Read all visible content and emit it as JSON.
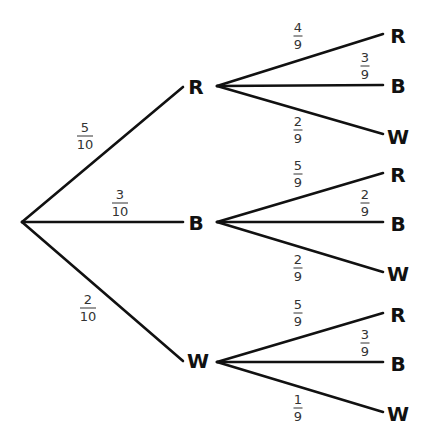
{
  "diagram": {
    "type": "probability-tree",
    "root": {
      "x": 22,
      "y": 222
    },
    "level1": [
      {
        "label": "R",
        "prob": {
          "num": "5",
          "den": "10"
        },
        "label_pos": [
          196,
          87
        ],
        "end": [
          183,
          87
        ],
        "start": [
          217,
          86
        ],
        "frac_pos": [
          85,
          136
        ]
      },
      {
        "label": "B",
        "prob": {
          "num": "3",
          "den": "10"
        },
        "label_pos": [
          196,
          223
        ],
        "end": [
          183,
          222
        ],
        "start": [
          217,
          222
        ],
        "frac_pos": [
          120,
          203
        ]
      },
      {
        "label": "W",
        "prob": {
          "num": "2",
          "den": "10"
        },
        "label_pos": [
          198,
          361
        ],
        "end": [
          183,
          361
        ],
        "start": [
          217,
          362
        ],
        "frac_pos": [
          88,
          308
        ]
      }
    ],
    "level2": [
      [
        {
          "label": "R",
          "prob": {
            "num": "4",
            "den": "9"
          },
          "end": [
            383,
            34
          ],
          "label_pos": [
            398,
            36
          ],
          "frac_pos": [
            298,
            36
          ]
        },
        {
          "label": "B",
          "prob": {
            "num": "3",
            "den": "9"
          },
          "end": [
            383,
            85
          ],
          "label_pos": [
            398,
            86
          ],
          "frac_pos": [
            365,
            66
          ]
        },
        {
          "label": "W",
          "prob": {
            "num": "2",
            "den": "9"
          },
          "end": [
            383,
            134
          ],
          "label_pos": [
            398,
            137
          ],
          "frac_pos": [
            298,
            130
          ]
        }
      ],
      [
        {
          "label": "R",
          "prob": {
            "num": "5",
            "den": "9"
          },
          "end": [
            383,
            173
          ],
          "label_pos": [
            398,
            175
          ],
          "frac_pos": [
            298,
            174
          ]
        },
        {
          "label": "B",
          "prob": {
            "num": "2",
            "den": "9"
          },
          "end": [
            383,
            222
          ],
          "label_pos": [
            398,
            224
          ],
          "frac_pos": [
            365,
            203
          ]
        },
        {
          "label": "W",
          "prob": {
            "num": "2",
            "den": "9"
          },
          "end": [
            383,
            272
          ],
          "label_pos": [
            398,
            274
          ],
          "frac_pos": [
            298,
            268
          ]
        }
      ],
      [
        {
          "label": "R",
          "prob": {
            "num": "5",
            "den": "9"
          },
          "end": [
            383,
            313
          ],
          "label_pos": [
            398,
            315
          ],
          "frac_pos": [
            298,
            313
          ]
        },
        {
          "label": "B",
          "prob": {
            "num": "3",
            "den": "9"
          },
          "end": [
            383,
            362
          ],
          "label_pos": [
            398,
            364
          ],
          "frac_pos": [
            365,
            343
          ]
        },
        {
          "label": "W",
          "prob": {
            "num": "1",
            "den": "9"
          },
          "end": [
            383,
            412
          ],
          "label_pos": [
            398,
            414
          ],
          "frac_pos": [
            298,
            408
          ]
        }
      ]
    ]
  }
}
